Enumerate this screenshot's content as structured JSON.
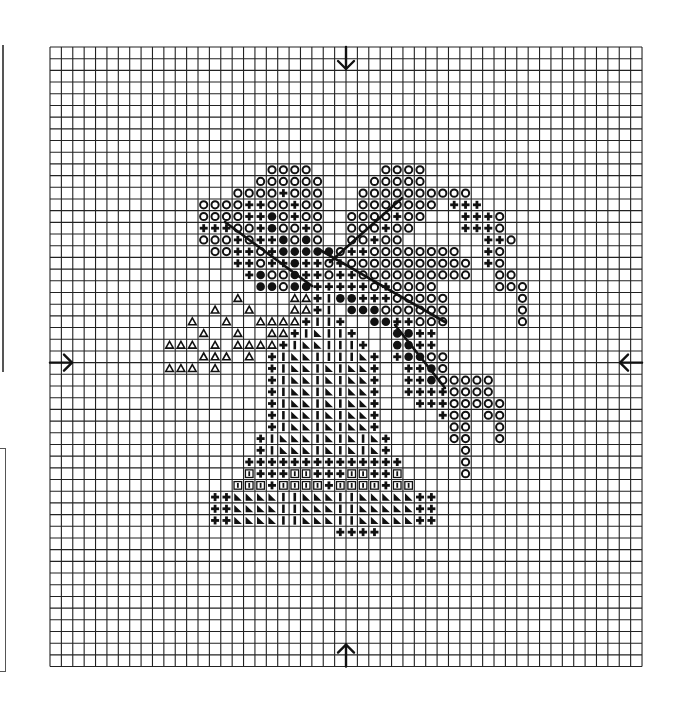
{
  "chart_data": {
    "type": "cross-stitch-pattern",
    "title": "",
    "grid": {
      "columns": 52,
      "rows": 53,
      "origin_px": [
        50,
        47
      ],
      "cell_w": 11.385,
      "cell_h": 11.69
    },
    "center_markers": [
      {
        "side": "top",
        "direction": "down",
        "grid_col_line": 26
      },
      {
        "side": "bottom",
        "direction": "up",
        "grid_col_line": 26
      },
      {
        "side": "left",
        "direction": "right",
        "grid_row_line": 27
      },
      {
        "side": "right",
        "direction": "left",
        "grid_row_line": 27
      }
    ],
    "legend": {
      "O": "open-circle",
      "+": "bold-plus",
      "@": "filled-circle",
      "A": "open-triangle",
      "|": "vertical-bar",
      "L": "filled-corner-triangle",
      "B": "boxed-bar"
    },
    "rows": {
      "10": "...................OOOO......OOOO...................",
      "11": "..................OOOOOO....OOOOO...................",
      "12": "................OOOO+OOO...OOOOOOOOOO...............",
      "13": ".............OOOO++OO+OO...OOOOOOO.+++..............",
      "14": ".............OOOO++@O+OO..OOOO+OO...+++O............",
      "15": ".............+++OO+@OO+O..OOO+OO....+++O............",
      "16": ".............OOO+O++@O@O..OO+OO.......++O............",
      "17": "..............OO++O+@@@@@O++OOOOOOOO..+O............",
      "18": "................++O++@++O+OOOOOOOOOOO.+O............",
      "19": ".................+@OO@++O++OOOOOOOOOO..OO...........",
      "20": "..................@@O@@+++++O+OOOO.....OOO..........",
      "21": "................A....AA+|@@+++OOOOO......O..........",
      "22": "..............A..A...AA+|.@@@OOOOOO......O..........",
      "23": "............A..A..AAAA+||+..@@++OOO......O..........",
      "24": ".............A..A..AA+|L||+...@@++..................",
      "25": "..........AAA.A.AAAA+|LL|||+..@@++..................",
      "26": ".............AAA.A.+|LL||||L+.+@@OO................",
      "27": "..........AAA.A....+|LL|L|LL+..++@O................",
      "28": "...................+|LL|L|LL+..++@OOOOO.............",
      "29": "...................+|LL|L|LL+..++++OOOO.............",
      "30": "...................+|LL|L|LL+...+++OOOOO............",
      "31": "...................+|LL|L|LL+.....+OO.OO............",
      "32": "...................+|LL|L|LL+......OO..O............",
      "33": "..................+|LLL|L|L|L+.....OO..O............",
      "34": "..................+|LLL|L|L|L+......O...............",
      "35": ".................++++++++++++++.....O...............",
      "36": ".................B+++BB+++BB++B.....O...............",
      "37": "................BBB+BBBB+BBBB+BB....................",
      "38": "..............++LLLL||LLL||LLLLL++..................",
      "39": "..............++LLLL||LLL||LLLLL++..................",
      "40": "..............++LLLL||LLL||LLLLL++..................",
      "41": ".........................++++......................"
    },
    "backstitch_lines_px": [
      [
        225,
        222,
        312,
        286
      ],
      [
        402,
        198,
        330,
        262
      ],
      [
        320,
        250,
        445,
        322
      ],
      [
        395,
        325,
        445,
        388
      ]
    ]
  },
  "page": {
    "left_rule": {
      "x": 3,
      "y1": 45,
      "y2": 372
    },
    "left_box": {
      "x": 0,
      "y": 448,
      "w": 6,
      "h": 222
    }
  }
}
